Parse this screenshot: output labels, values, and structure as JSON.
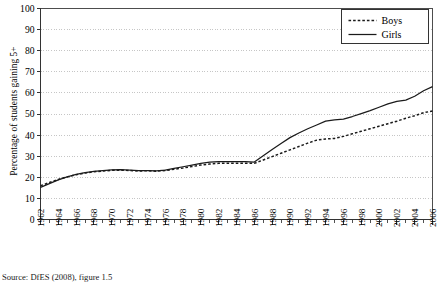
{
  "axes": {
    "ylabel": "Percentage of students gaining 5+",
    "yticks": [
      "0",
      "10",
      "20",
      "30",
      "40",
      "50",
      "60",
      "70",
      "80",
      "90",
      "100"
    ],
    "xticks": [
      "1962",
      "1964",
      "1966",
      "1968",
      "1970",
      "1972",
      "1974",
      "1976",
      "1978",
      "1980",
      "1982",
      "1984",
      "1986",
      "1988",
      "1990",
      "1992",
      "1994",
      "1996",
      "1998",
      "2000",
      "2002",
      "2004",
      "2006"
    ]
  },
  "legend": {
    "items": [
      {
        "label": "Boys",
        "style": "dashed"
      },
      {
        "label": "Girls",
        "style": "solid"
      }
    ]
  },
  "caption": "Source: DfES (2008), figure 1.5",
  "colors": {
    "line": "#1a1a1a",
    "grid": "#b8b8b8",
    "axis": "#4d4d4d",
    "background": "#ffffff"
  },
  "chart_data": {
    "type": "line",
    "title": "",
    "xlabel": "",
    "ylabel": "Percentage of students gaining 5+",
    "xlim": [
      1962,
      2006
    ],
    "ylim": [
      0,
      100
    ],
    "ytick_step": 10,
    "xtick_step": 2,
    "xminor_tick_step": 1,
    "grid": "horizontal-dotted",
    "legend_position": "top-right",
    "x": [
      1962,
      1963,
      1964,
      1965,
      1966,
      1967,
      1968,
      1969,
      1970,
      1971,
      1972,
      1973,
      1974,
      1975,
      1976,
      1977,
      1978,
      1979,
      1980,
      1981,
      1982,
      1983,
      1984,
      1985,
      1986,
      1987,
      1988,
      1989,
      1990,
      1991,
      1992,
      1993,
      1994,
      1995,
      1996,
      1997,
      1998,
      1999,
      2000,
      2001,
      2002,
      2003,
      2004,
      2005,
      2006
    ],
    "series": [
      {
        "name": "Boys",
        "style": "dashed",
        "values": [
          16.0,
          17.5,
          19.0,
          20.2,
          21.2,
          22.0,
          22.6,
          23.0,
          23.3,
          23.4,
          23.2,
          23.0,
          23.1,
          22.9,
          23.2,
          23.8,
          24.4,
          25.1,
          25.8,
          26.3,
          26.6,
          26.6,
          26.6,
          26.6,
          26.6,
          28.2,
          29.8,
          31.4,
          33.0,
          34.6,
          36.2,
          37.6,
          38.2,
          38.4,
          39.4,
          40.6,
          41.8,
          43.0,
          44.2,
          45.4,
          46.6,
          48.0,
          49.2,
          50.6,
          51.4
        ]
      },
      {
        "name": "Girls",
        "style": "solid",
        "values": [
          15.2,
          17.0,
          18.8,
          20.2,
          21.4,
          22.2,
          22.8,
          23.2,
          23.5,
          23.6,
          23.4,
          23.2,
          23.2,
          23.0,
          23.4,
          24.2,
          25.0,
          25.8,
          26.6,
          27.2,
          27.4,
          27.4,
          27.4,
          27.4,
          27.2,
          30.2,
          33.2,
          36.0,
          38.8,
          41.0,
          43.0,
          44.8,
          46.6,
          47.2,
          47.6,
          48.8,
          50.2,
          51.6,
          53.2,
          54.8,
          56.0,
          56.6,
          58.4,
          61.0,
          63.0
        ]
      }
    ]
  }
}
